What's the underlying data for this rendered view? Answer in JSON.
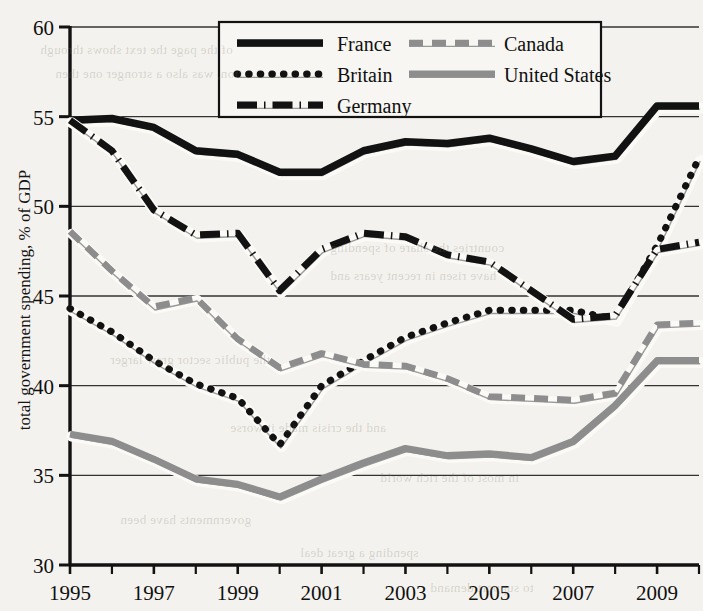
{
  "chart_data": {
    "type": "line",
    "title": "",
    "xlabel": "",
    "ylabel": "total government spending, % of GDP",
    "xlim": [
      1995,
      2010
    ],
    "ylim": [
      30,
      60
    ],
    "ytick_values": [
      30,
      35,
      40,
      45,
      50,
      55,
      60
    ],
    "ytick_labels": [
      "30",
      "35",
      "40",
      "45",
      "50",
      "55",
      "60"
    ],
    "xtick_values": [
      1995,
      1997,
      1999,
      2001,
      2003,
      2005,
      2007,
      2009
    ],
    "xtick_labels": [
      "1995",
      "1997",
      "1999",
      "2001",
      "2003",
      "2005",
      "2007",
      "2009"
    ],
    "xtick_minor_values": [
      1996,
      1998,
      2000,
      2002,
      2004,
      2006,
      2008,
      2010
    ],
    "grid": "horizontal",
    "legend_position": "top-center",
    "x": [
      1995,
      1996,
      1997,
      1998,
      1999,
      2000,
      2001,
      2002,
      2003,
      2004,
      2005,
      2006,
      2007,
      2008,
      2009,
      2010
    ],
    "series": [
      {
        "name": "France",
        "style": "solid",
        "color": "#121212",
        "values": [
          54.8,
          54.9,
          54.4,
          53.1,
          52.9,
          51.9,
          51.9,
          53.1,
          53.6,
          53.5,
          53.8,
          53.2,
          52.5,
          52.8,
          55.6,
          55.6
        ]
      },
      {
        "name": "Britain",
        "style": "dotted",
        "color": "#121212",
        "values": [
          44.3,
          43.0,
          41.4,
          40.1,
          39.3,
          36.7,
          40.0,
          41.4,
          42.7,
          43.5,
          44.2,
          44.2,
          44.2,
          43.7,
          47.8,
          52.7
        ]
      },
      {
        "name": "Germany",
        "style": "dashdot",
        "color": "#121212",
        "values": [
          54.8,
          53.1,
          49.8,
          48.4,
          48.5,
          45.3,
          47.6,
          48.5,
          48.3,
          47.3,
          46.9,
          45.3,
          43.7,
          43.9,
          47.6,
          48.0
        ]
      },
      {
        "name": "Canada",
        "style": "dashed",
        "color": "#8d8d8d",
        "values": [
          48.6,
          46.4,
          44.4,
          44.9,
          42.6,
          41.0,
          41.8,
          41.2,
          41.1,
          40.4,
          39.4,
          39.3,
          39.2,
          39.6,
          43.4,
          43.5
        ]
      },
      {
        "name": "United States",
        "style": "solid-gray",
        "color": "#8d8d8d",
        "values": [
          37.3,
          36.9,
          35.9,
          34.8,
          34.5,
          33.8,
          34.8,
          35.7,
          36.5,
          36.1,
          36.2,
          36.0,
          36.9,
          38.9,
          41.4,
          41.4
        ]
      }
    ]
  },
  "legend": {
    "entries": [
      {
        "label": "France",
        "style": "solid"
      },
      {
        "label": "Britain",
        "style": "dotted"
      },
      {
        "label": "Germany",
        "style": "dashdot"
      },
      {
        "label": "Canada",
        "style": "dashed"
      },
      {
        "label": "United States",
        "style": "solid-gray"
      }
    ]
  },
  "background_bleed": [
    "of the page the text shows through",
    "tion, was also a stronger one then",
    "countries the share of spending",
    "have risen in recent years and",
    "the public sector grew larger",
    "and the crisis made it worse",
    "in most of the rich world",
    "governments have been",
    "spending a great deal",
    "to support demand"
  ],
  "colors": {
    "ink": "#121212",
    "gray_series": "#8d8d8d",
    "paper": "#f4f2ee",
    "gridline": "#333333"
  }
}
